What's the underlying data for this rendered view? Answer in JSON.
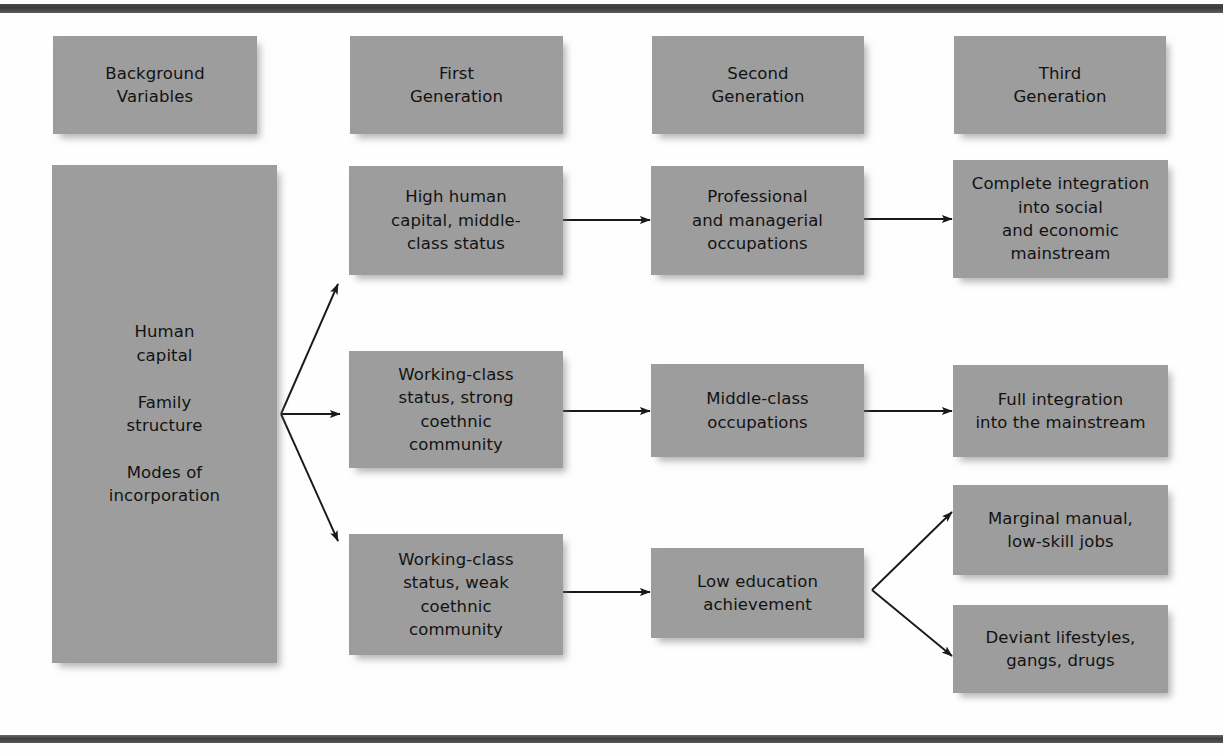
{
  "diagram": {
    "box_fill": "#9d9d9d",
    "text_color": "#121212",
    "arrow_color": "#1a1a1a",
    "headers": [
      {
        "id": "background-variables",
        "label": "Background\nVariables"
      },
      {
        "id": "first-generation",
        "label": "First\nGeneration"
      },
      {
        "id": "second-generation",
        "label": "Second\nGeneration"
      },
      {
        "id": "third-generation",
        "label": "Third\nGeneration"
      }
    ],
    "background": {
      "id": "background-factors",
      "label": "Human\ncapital\n\nFamily\nstructure\n\nModes of\nincorporation"
    },
    "first_generation": [
      {
        "id": "high-human-capital",
        "label": "High human\ncapital, middle-\nclass status"
      },
      {
        "id": "working-class-strong",
        "label": "Working-class\nstatus, strong\ncoethnic\ncommunity"
      },
      {
        "id": "working-class-weak",
        "label": "Working-class\nstatus, weak\ncoethnic\ncommunity"
      }
    ],
    "second_generation": [
      {
        "id": "professional-managerial",
        "label": "Professional\nand managerial\noccupations"
      },
      {
        "id": "middle-class-occupations",
        "label": "Middle-class\noccupations"
      },
      {
        "id": "low-education",
        "label": "Low education\nachievement"
      }
    ],
    "third_generation": [
      {
        "id": "complete-integration",
        "label": "Complete integration\ninto social\nand economic\nmainstream"
      },
      {
        "id": "full-integration",
        "label": "Full integration\ninto the mainstream"
      },
      {
        "id": "marginal-manual",
        "label": "Marginal manual,\nlow-skill jobs"
      },
      {
        "id": "deviant-lifestyles",
        "label": "Deviant  lifestyles,\ngangs, drugs"
      }
    ]
  }
}
